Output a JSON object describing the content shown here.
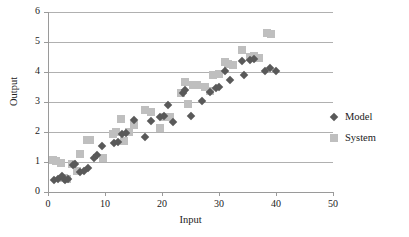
{
  "chart_data": {
    "type": "scatter",
    "title": "",
    "xlabel": "Input",
    "ylabel": "Output",
    "xlim": [
      0,
      50
    ],
    "ylim": [
      0,
      6
    ],
    "xticks": [
      0,
      10,
      20,
      30,
      40,
      50
    ],
    "yticks": [
      0,
      1,
      2,
      3,
      4,
      5,
      6
    ],
    "grid": "horizontal",
    "legend_position": "right",
    "series": [
      {
        "name": "Model",
        "marker": "diamond",
        "color": "#595959",
        "points": [
          [
            1.0,
            0.4
          ],
          [
            1.8,
            0.45
          ],
          [
            2.4,
            0.52
          ],
          [
            3.0,
            0.4
          ],
          [
            3.5,
            0.42
          ],
          [
            4.3,
            0.9
          ],
          [
            4.8,
            0.95
          ],
          [
            5.6,
            0.66
          ],
          [
            6.3,
            0.7
          ],
          [
            7.0,
            0.8
          ],
          [
            8.0,
            1.12
          ],
          [
            8.6,
            1.22
          ],
          [
            9.4,
            1.55
          ],
          [
            11.6,
            1.62
          ],
          [
            12.3,
            1.66
          ],
          [
            13.0,
            1.95
          ],
          [
            13.6,
            1.98
          ],
          [
            15.0,
            2.41
          ],
          [
            17.0,
            1.84
          ],
          [
            18.0,
            2.36
          ],
          [
            19.6,
            2.5
          ],
          [
            20.4,
            2.52
          ],
          [
            21.0,
            2.9
          ],
          [
            22.0,
            2.34
          ],
          [
            23.6,
            3.3
          ],
          [
            24.0,
            3.39
          ],
          [
            25.0,
            2.55
          ],
          [
            27.0,
            3.02
          ],
          [
            28.4,
            3.35
          ],
          [
            29.4,
            3.48
          ],
          [
            30.0,
            3.5
          ],
          [
            31.0,
            4.02
          ],
          [
            32.0,
            3.74
          ],
          [
            34.0,
            4.38
          ],
          [
            34.4,
            3.9
          ],
          [
            35.4,
            4.4
          ],
          [
            36.2,
            4.42
          ],
          [
            38.0,
            4.04
          ],
          [
            39.0,
            4.12
          ],
          [
            40.0,
            4.05
          ]
        ]
      },
      {
        "name": "System",
        "marker": "square",
        "color": "#bfbfbf",
        "points": [
          [
            0.8,
            1.08
          ],
          [
            1.4,
            1.05
          ],
          [
            2.2,
            0.98
          ],
          [
            2.8,
            0.46
          ],
          [
            3.4,
            0.42
          ],
          [
            4.2,
            0.92
          ],
          [
            5.0,
            0.7
          ],
          [
            5.6,
            1.26
          ],
          [
            6.8,
            1.72
          ],
          [
            7.4,
            1.74
          ],
          [
            9.6,
            1.12
          ],
          [
            11.4,
            1.95
          ],
          [
            12.0,
            2.0
          ],
          [
            12.8,
            2.44
          ],
          [
            13.4,
            1.7
          ],
          [
            14.2,
            2.0
          ],
          [
            15.0,
            2.22
          ],
          [
            17.0,
            2.73
          ],
          [
            18.0,
            2.66
          ],
          [
            19.6,
            2.12
          ],
          [
            20.6,
            2.5
          ],
          [
            21.4,
            2.5
          ],
          [
            23.4,
            3.3
          ],
          [
            24.0,
            3.68
          ],
          [
            24.6,
            2.94
          ],
          [
            25.4,
            3.58
          ],
          [
            26.2,
            3.56
          ],
          [
            27.6,
            3.5
          ],
          [
            28.4,
            3.36
          ],
          [
            29.0,
            3.9
          ],
          [
            30.0,
            3.92
          ],
          [
            31.0,
            4.32
          ],
          [
            31.6,
            4.28
          ],
          [
            32.4,
            4.24
          ],
          [
            34.0,
            4.72
          ],
          [
            35.4,
            4.5
          ],
          [
            36.2,
            4.52
          ],
          [
            37.0,
            4.46
          ],
          [
            38.4,
            5.3
          ],
          [
            39.2,
            5.26
          ]
        ]
      }
    ]
  },
  "legend": {
    "items": [
      {
        "label": "Model"
      },
      {
        "label": "System"
      }
    ]
  }
}
